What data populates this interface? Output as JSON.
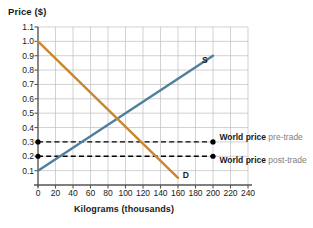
{
  "chart_data": {
    "type": "line",
    "title": "",
    "xlabel": "Kilograms (thousands)",
    "ylabel": "Price ($)",
    "xlim": [
      0,
      240
    ],
    "ylim": [
      0,
      1.1
    ],
    "grid": true,
    "legend": "none",
    "xticks": [
      0,
      20,
      40,
      60,
      80,
      100,
      120,
      140,
      160,
      180,
      200,
      220,
      240
    ],
    "yticks": [
      "0.1",
      "0.2",
      "0.3",
      "0.4",
      "0.5",
      "0.6",
      "0.7",
      "0.8",
      "0.9",
      "1.0",
      "1.1"
    ],
    "series": [
      {
        "name": "S",
        "label": "S",
        "color": "#4f7f9f",
        "type": "line",
        "points": [
          [
            0,
            0.1
          ],
          [
            200,
            0.9
          ]
        ],
        "label_point": [
          185,
          0.86
        ]
      },
      {
        "name": "D",
        "label": "D",
        "color": "#c8872f",
        "type": "line",
        "points": [
          [
            0,
            1.0
          ],
          [
            160,
            0.05
          ]
        ],
        "label_point": [
          163,
          0.06
        ]
      }
    ],
    "reference_lines": [
      {
        "name": "world-price-pre-trade",
        "value": 0.3,
        "orientation": "horizontal",
        "style": "dashed",
        "color": "#000000",
        "x_from": 0,
        "x_to": 200,
        "markers": [
          [
            0,
            0.3
          ],
          [
            200,
            0.3
          ]
        ]
      },
      {
        "name": "world-price-post-trade",
        "value": 0.2,
        "orientation": "horizontal",
        "style": "dashed",
        "color": "#000000",
        "x_from": 0,
        "x_to": 200,
        "markers": [
          [
            0,
            0.2
          ],
          [
            200,
            0.2
          ]
        ]
      }
    ],
    "annotations": [
      {
        "name": "world-price-pre-trade-label",
        "strong": "World price",
        "soft": "pre-trade",
        "at": [
          205,
          0.33
        ]
      },
      {
        "name": "world-price-post-trade-label",
        "strong": "World price",
        "soft": "post-trade",
        "at": [
          205,
          0.17
        ]
      }
    ],
    "equilibrium": {
      "quantity": 80,
      "price": 0.5
    }
  },
  "axes": {
    "y_title": "Price ($)",
    "x_title": "Kilograms (thousands)"
  },
  "colors": {
    "supply": "#4f7f9f",
    "demand": "#c8872f",
    "grid": "#bfbfbf",
    "axis": "#555555",
    "dashed": "#000000",
    "soft_text": "#808080"
  }
}
